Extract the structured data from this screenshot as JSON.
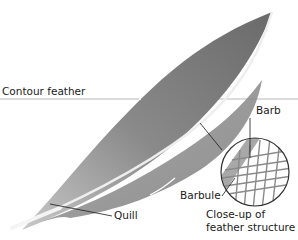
{
  "diagram": {
    "subject": "Contour feather",
    "labels": {
      "contour_feather": "Contour feather",
      "barb": "Barb",
      "barbule": "Barbule",
      "quill": "Quill",
      "closeup_line1": "Close-up of",
      "closeup_line2": "feather structure"
    },
    "colors": {
      "feather_dark": "#6e6e6e",
      "feather_light": "#b8b8b8",
      "shaft": "#e8e8e8",
      "rule_line": "#b0b0b0",
      "leader_line": "#1a1a1a",
      "text": "#1a1a1a"
    }
  }
}
